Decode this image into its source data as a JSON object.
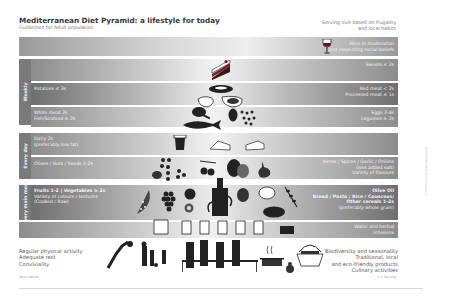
{
  "header": {
    "title": "Mediterranean Diet Pyramid: a lifestyle for today",
    "subtitle": "Guidelines for Adult population",
    "serving_note_line1": "Serving size based on frugality",
    "serving_note_line2": "and local habits"
  },
  "tiers": {
    "wine": {
      "line1": "Wine in moderation",
      "line2": "and respecting social beliefs",
      "icon": "wine-glass-icon"
    },
    "sweets": {
      "right": "Sweets ≤ 2s",
      "icon": "cake-slice-icon"
    },
    "potatoes_meat": {
      "left": "Potatoes ≤ 3s",
      "right1": "Red meat < 2s",
      "right2": "Processed meat ≤ 1s"
    },
    "poultry_fish": {
      "left1": "White meat 2s",
      "left2": "Fish/Seafood ≥ 2s",
      "right1": "Eggs 2-4s",
      "right2": "Legumes ≥ 2s"
    },
    "dairy": {
      "left1": "Dairy 2s",
      "left2": "(preferably low fat)"
    },
    "olives": {
      "left": "Olives / Nuts / Seeds 1-2s",
      "right1": "Herbs / Spices / Garlic / Onions",
      "right2": "(less added salt)",
      "right3": "Variety of flavours"
    },
    "main": {
      "left1": "Fruits 1-2 | Vegetables ≥ 2s",
      "left2": "Variety of colours / textures",
      "left3": "(Cooked / Raw)",
      "right1": "Olive Oil",
      "right2": "Bread / Pasta / Rice / Couscous/",
      "right3": "Other cereals 1-2s",
      "right4": "(preferably whole grain)"
    },
    "water": {
      "line1": "Water and herbal",
      "line2": "infusions"
    }
  },
  "side_labels": {
    "weekly": "Weekly",
    "every_day": "Every day",
    "every_main_meal": "Every main meal"
  },
  "footer": {
    "left": [
      "Regular physical activity",
      "Adequate rest",
      "Conviviality"
    ],
    "right": [
      "Biodiversity and seasonality",
      "Traditional, local",
      "and eco-friendly products",
      "Culinary activities"
    ],
    "edition": "2010 edition",
    "serving_legend": "s = Serving",
    "vertical_note": "© 2010 Fundación Dieta Mediterránea"
  },
  "colors": {
    "band_dark": "#6e6e6e",
    "band_light": "#f2f2f2",
    "side_label": "#7a7a7a",
    "title_text": "#3a3a3a"
  }
}
